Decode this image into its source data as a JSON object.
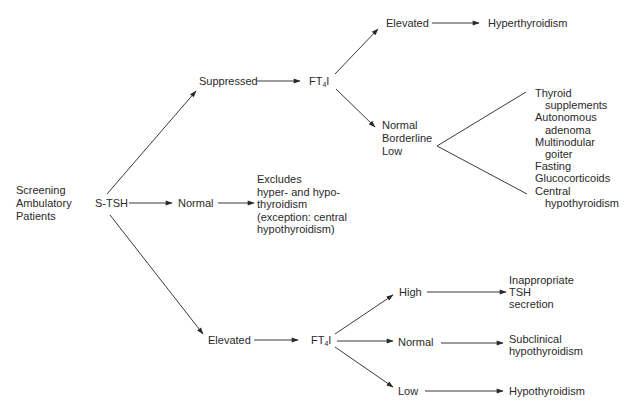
{
  "diagram": {
    "type": "flowchart",
    "nodes": {
      "screening": {
        "lines": [
          "Screening",
          "Ambulatory",
          "Patients"
        ]
      },
      "stsh": {
        "label": "S-TSH"
      },
      "suppressed": {
        "label": "Suppressed"
      },
      "ft4i_top": {
        "prefix": "FT",
        "sub": "4",
        "suffix": "I"
      },
      "elevated_top": {
        "label": "Elevated"
      },
      "hyperthyroidism": {
        "label": "Hyperthyroidism"
      },
      "normal_borderline_low": {
        "lines": [
          "Normal",
          "Borderline",
          "Low"
        ]
      },
      "causes_list": {
        "items": [
          {
            "text": "Thyroid",
            "indent": false
          },
          {
            "text": "supplements",
            "indent": true
          },
          {
            "text": "Autonomous",
            "indent": false
          },
          {
            "text": "adenoma",
            "indent": true
          },
          {
            "text": "Multinodular",
            "indent": false
          },
          {
            "text": "goiter",
            "indent": true
          },
          {
            "text": "Fasting",
            "indent": false
          },
          {
            "text": "Glucocorticoids",
            "indent": false
          },
          {
            "text": "Central",
            "indent": false
          },
          {
            "text": "hypothyroidism",
            "indent": true
          }
        ]
      },
      "normal_mid": {
        "label": "Normal"
      },
      "excludes": {
        "lines": [
          "Excludes",
          "hyper- and hypo-",
          "thyroidism",
          "(exception: central",
          "hypothyroidism)"
        ]
      },
      "elevated_bottom": {
        "label": "Elevated"
      },
      "ft4i_bottom": {
        "prefix": "FT",
        "sub": "4",
        "suffix": "I"
      },
      "high": {
        "label": "High"
      },
      "normal_bottom": {
        "label": "Normal"
      },
      "low": {
        "label": "Low"
      },
      "inappropriate_tsh": {
        "lines": [
          "Inappropriate",
          "TSH",
          "secretion"
        ]
      },
      "subclinical": {
        "lines": [
          "Subclinical",
          "hypothyroidism"
        ]
      },
      "hypothyroidism": {
        "label": "Hypothyroidism"
      }
    },
    "colors": {
      "line": "#3a3a3a",
      "text": "#2a2a2a",
      "background": "#ffffff"
    }
  }
}
